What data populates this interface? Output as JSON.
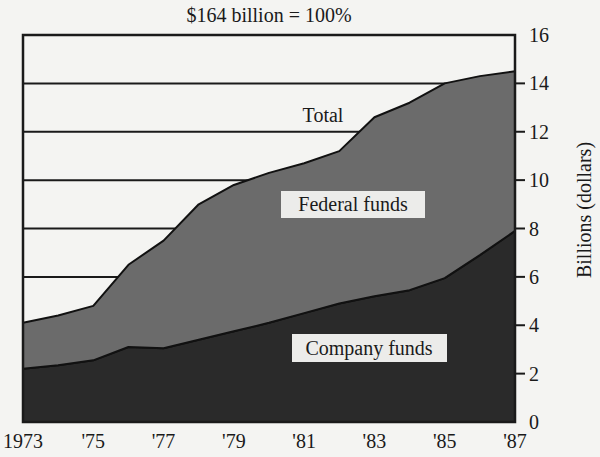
{
  "chart_data": {
    "type": "area",
    "stacked": true,
    "title": "$164 billion = 100%",
    "xlabel": "",
    "ylabel": "Billions (dollars)",
    "ylim": [
      0,
      16
    ],
    "yticks": [
      0,
      2,
      4,
      6,
      8,
      10,
      12,
      14,
      16
    ],
    "y_axis_position": "right",
    "grid": {
      "horizontal": true,
      "visible_lines": [
        6,
        8,
        10,
        12,
        14
      ]
    },
    "x": [
      1973,
      1974,
      1975,
      1976,
      1977,
      1978,
      1979,
      1980,
      1981,
      1982,
      1983,
      1984,
      1985,
      1986,
      1987
    ],
    "xtick_values": [
      1973,
      1975,
      1977,
      1979,
      1981,
      1983,
      1985,
      1987
    ],
    "xtick_labels": [
      "1973",
      "'75",
      "'77",
      "'79",
      "'81",
      "'83",
      "'85",
      "'87"
    ],
    "series": [
      {
        "name": "Company funds",
        "color": "#2a2a2a",
        "values": [
          2.2,
          2.35,
          2.55,
          3.1,
          3.05,
          3.4,
          3.75,
          4.1,
          4.5,
          4.9,
          5.2,
          5.45,
          5.95,
          6.9,
          7.9
        ]
      },
      {
        "name": "Federal funds",
        "color": "#6b6b6b",
        "values": [
          1.9,
          2.05,
          2.25,
          3.4,
          4.45,
          5.6,
          6.05,
          6.2,
          6.2,
          6.3,
          7.4,
          7.75,
          8.05,
          7.4,
          6.6
        ]
      }
    ],
    "total": {
      "name": "Total",
      "values": [
        4.1,
        4.4,
        4.8,
        6.5,
        7.5,
        9.0,
        9.8,
        10.3,
        10.7,
        11.2,
        12.6,
        13.2,
        14.0,
        14.3,
        14.5
      ]
    },
    "annotations": [
      {
        "text": "Total",
        "x": 1981.0,
        "y": 12.4
      },
      {
        "text": "Federal funds",
        "x": 1981.7,
        "y": 8.8,
        "boxed": true
      },
      {
        "text": "Company funds",
        "x": 1982.4,
        "y": 2.9,
        "boxed": true
      }
    ]
  },
  "labels": {
    "title": "$164 billion = 100%",
    "ylabel": "Billions (dollars)",
    "total": "Total",
    "federal": "Federal funds",
    "company": "Company funds"
  }
}
